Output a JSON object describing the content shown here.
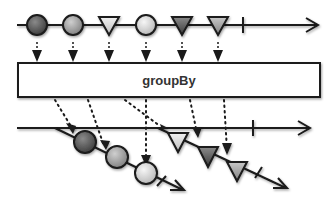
{
  "operator": {
    "label": "groupBy"
  },
  "source": {
    "items": [
      {
        "shape": "circle",
        "shade": "dark",
        "color": "#5a5a5a"
      },
      {
        "shape": "circle",
        "shade": "medium",
        "color": "#9a9a9a"
      },
      {
        "shape": "triangle",
        "shade": "light",
        "color": "#d8d8d8"
      },
      {
        "shape": "circle",
        "shade": "light",
        "color": "#d8d8d8"
      },
      {
        "shape": "triangle",
        "shade": "dark",
        "color": "#5a5a5a"
      },
      {
        "shape": "triangle",
        "shade": "medium",
        "color": "#a0a0a0"
      }
    ],
    "completed": true
  },
  "output": {
    "groups": [
      {
        "key": "circle",
        "items": [
          {
            "shape": "circle",
            "shade": "dark",
            "color": "#5a5a5a"
          },
          {
            "shape": "circle",
            "shade": "medium",
            "color": "#9a9a9a"
          },
          {
            "shape": "circle",
            "shade": "light",
            "color": "#d8d8d8"
          }
        ],
        "completed": true
      },
      {
        "key": "triangle",
        "items": [
          {
            "shape": "triangle",
            "shade": "light",
            "color": "#d8d8d8"
          },
          {
            "shape": "triangle",
            "shade": "dark",
            "color": "#5a5a5a"
          },
          {
            "shape": "triangle",
            "shade": "medium",
            "color": "#a0a0a0"
          }
        ],
        "completed": true
      }
    ],
    "completed": true
  },
  "colors": {
    "line": "#1a1a1a",
    "box_fill": "#ffffff",
    "box_stroke": "#1a1a1a"
  }
}
